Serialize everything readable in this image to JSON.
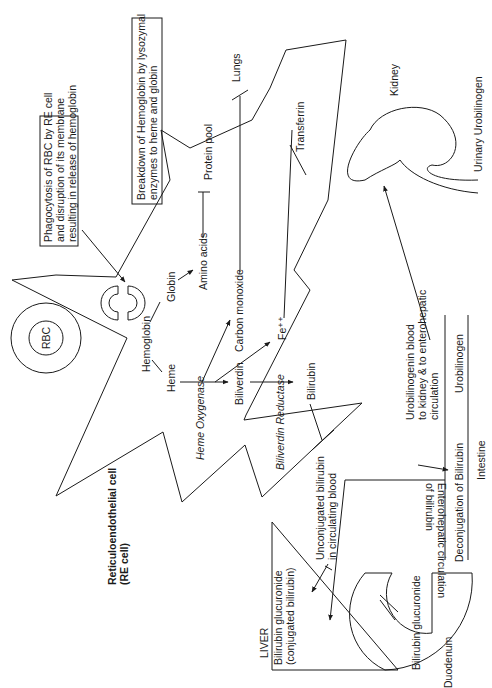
{
  "labels": {
    "rbc": "RBC",
    "phagocytosis_box": [
      "Phagocytosis of RBC by RE cell",
      "and disruption of its membrane",
      "resulting in release of hemoglobin"
    ],
    "breakdown_box": [
      "Breakdown of Hemoglobin by lysozymal",
      "enzymes to heme and globin"
    ],
    "hemoglobin": "Hemoglobin",
    "globin": "Globin",
    "amino_acids": "Amino acids",
    "protein_pool": "Protein pool",
    "heme": "Heme",
    "heme_oxygenase": "Heme Oxygenase",
    "carbon_monoxide": "Carbon monoxide",
    "lungs": "Lungs",
    "biliverdin": "Biliverdin",
    "fe": "Fe⁺⁺",
    "transferrin": "Transferrin",
    "biliverdin_reductase": "Biliverdin Reductase",
    "bilirubin": "Bilirubin",
    "re_cell": [
      "Reticuloendothelial cell",
      "(RE cell)"
    ],
    "unconjugated": [
      "Unconjugated bilirubin",
      "in circulating blood"
    ],
    "liver": "LIVER",
    "bilirubin_glucuronide_liver": [
      "Bilirubin glucuronide",
      "(conjugated bilirubin)"
    ],
    "bilirubin_glucuronide_duodenum": "Bilirubin glucuronide",
    "duodenum": "Duodenum",
    "deconjugation": "Deconjugation of Bilirubin",
    "enterohepatic": [
      "Enterohepatic circulation",
      "of bilirubin"
    ],
    "urobilinogen": "Urobilinogen",
    "intestine": "Intestine",
    "urobilinogen_blood": [
      "Urobilinogenin blood",
      "to kidney & to enterohepatic",
      "circulation"
    ],
    "kidney": "Kidney",
    "urinary_urobilinogen": "Urinary Urobilinogen"
  }
}
